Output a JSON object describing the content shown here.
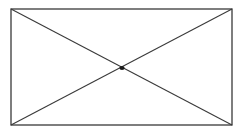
{
  "diagram": {
    "stroke_color": "#3a3a3a",
    "background": "#ffffff",
    "rectangle": {
      "x1": 11,
      "y1": 9,
      "x2": 232,
      "y2": 125
    },
    "diagonals": [
      {
        "from": [
          11,
          9
        ],
        "to": [
          232,
          125
        ]
      },
      {
        "from": [
          232,
          9
        ],
        "to": [
          11,
          125
        ]
      }
    ],
    "center_point": {
      "x": 122,
      "y": 68,
      "radius": 2
    }
  }
}
